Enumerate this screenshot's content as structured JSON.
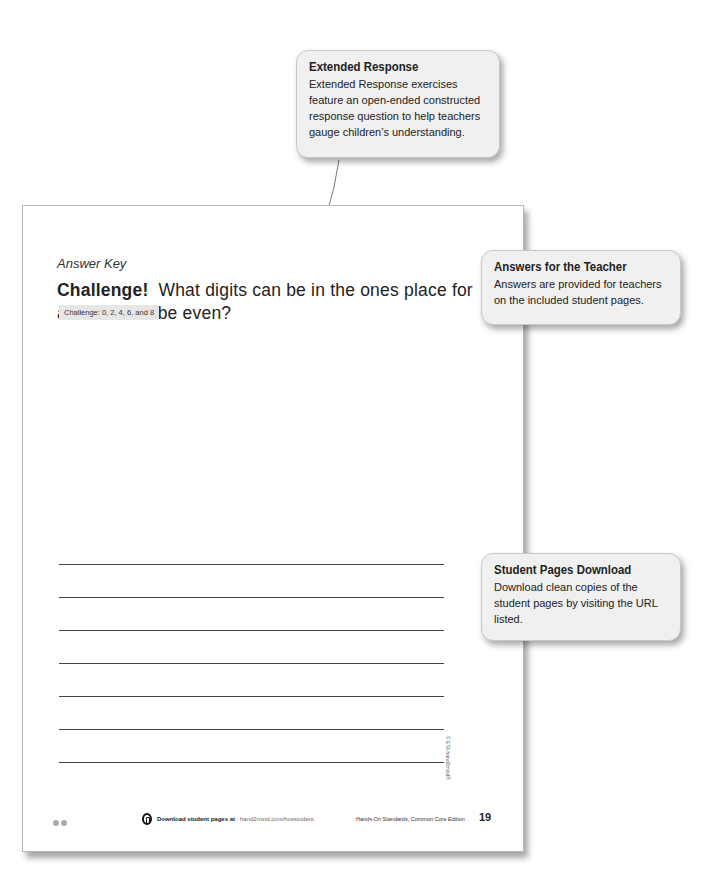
{
  "page": {
    "header_label": "Answer Key",
    "question": {
      "lead": "Challenge!",
      "text": "What digits can be in the ones place for a number to be even?"
    },
    "answer_badge": "Challenge: 0, 2, 4, 6, and 8",
    "writing_lines_count": 7,
    "copyright": "© ETA hand2mind®",
    "footer": {
      "download_icon": "download-circle-icon",
      "download_text": "Download student pages at",
      "download_url": "hand2mind.com/hosstudent.",
      "book_title": "Hands-On Standards, Common Core Edition",
      "page_number": "19"
    }
  },
  "callouts": [
    {
      "id": "extended-response",
      "title": "Extended Response",
      "body": "Extended Response exercises feature an open-ended constructed response question to help teachers gauge children’s understanding."
    },
    {
      "id": "answers-for-teacher",
      "title": "Answers for the Teacher",
      "body": "Answers are provided for teachers on the included student pages."
    },
    {
      "id": "student-pages-download",
      "title": "Student Pages Download",
      "body": "Download clean copies of the student pages by visiting the URL listed."
    }
  ],
  "colors": {
    "callout_bg": "#f0f0f0",
    "badge_bg": "#e6e6e6",
    "leader_line": "#777777"
  }
}
